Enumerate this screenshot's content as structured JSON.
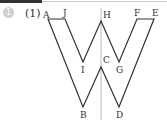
{
  "problem": {
    "number": "1",
    "part_label": "(1)"
  },
  "figure": {
    "axis_line_color": "#bbbbbb",
    "stroke_color": "#333333",
    "points": {
      "A": [
        48,
        19
      ],
      "J": [
        65,
        19
      ],
      "I": [
        83,
        62
      ],
      "H": [
        101,
        21
      ],
      "G": [
        119,
        62
      ],
      "F": [
        137,
        19
      ],
      "E": [
        154,
        19
      ],
      "D": [
        119,
        107
      ],
      "C": [
        101,
        67
      ],
      "B": [
        83,
        107
      ]
    },
    "labels": {
      "A": "A",
      "J": "J",
      "H": "H",
      "F": "F",
      "E": "E",
      "I": "I",
      "C": "C",
      "G": "G",
      "B": "B",
      "D": "D"
    }
  }
}
